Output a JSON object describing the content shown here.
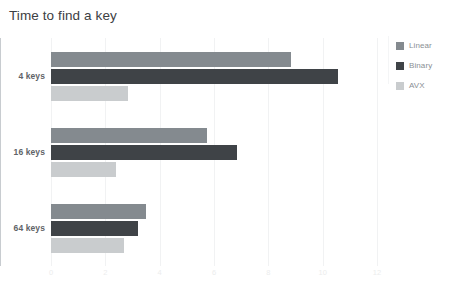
{
  "chart_data": {
    "type": "bar",
    "orientation": "horizontal",
    "title": "Time to find a key",
    "xlabel": "",
    "ylabel": "",
    "categories": [
      "4 keys",
      "16 keys",
      "64 keys"
    ],
    "series": [
      {
        "name": "Linear",
        "color": "#848a8f",
        "values": [
          8.85,
          5.75,
          3.5
        ]
      },
      {
        "name": "Binary",
        "color": "#3f4347",
        "values": [
          10.55,
          6.85,
          3.2
        ]
      },
      {
        "name": "AVX",
        "color": "#c9ccce",
        "values": [
          2.85,
          2.4,
          2.7
        ]
      }
    ],
    "xlim": [
      0,
      12
    ],
    "xticks": [
      0,
      2,
      4,
      6,
      8,
      10,
      12
    ],
    "xtick_labels": [
      "0",
      "2",
      "4",
      "6",
      "8",
      "10",
      "12"
    ],
    "grid": true,
    "grid_axis": "x",
    "legend_position": "right"
  },
  "legend": {
    "items": [
      {
        "label": "Linear"
      },
      {
        "label": "Binary"
      },
      {
        "label": "AVX"
      }
    ]
  }
}
